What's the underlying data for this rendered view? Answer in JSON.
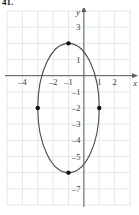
{
  "problem": {
    "number": "41."
  },
  "figure": {
    "axis_labels": {
      "x": "y",
      "x_axis": "x",
      "y_axis": "y"
    },
    "x_axis_name": "x",
    "y_axis_name": "y"
  },
  "chart_data": {
    "type": "scatter",
    "title": "",
    "subtitle": "",
    "xlabel": "x",
    "ylabel": "y",
    "grid": true,
    "legend": null,
    "xlim": [
      -5,
      3
    ],
    "ylim": [
      -8,
      4
    ],
    "xticks": [
      -4,
      -2,
      -1,
      1,
      2
    ],
    "xtick_labels": [
      "–4",
      "–2",
      "–1",
      "1",
      "2"
    ],
    "yticks": [
      3,
      1,
      -1,
      -2,
      -3,
      -4,
      -5,
      -7
    ],
    "ytick_labels": [
      "3",
      "1",
      "–1",
      "–2",
      "–3",
      "–4",
      "–5",
      "–7"
    ],
    "grid_step": 1,
    "curve": {
      "shape": "ellipse",
      "center": [
        -1,
        -2
      ],
      "semi_axis_x": 2,
      "semi_axis_y": 4,
      "stroke": "#4a4a4a",
      "stroke_width": 1.1,
      "fill": "none"
    },
    "points": [
      {
        "label": "top-vertex",
        "x": -1,
        "y": 2
      },
      {
        "label": "right-covertex",
        "x": 1,
        "y": -2
      },
      {
        "label": "bottom-vertex",
        "x": -1,
        "y": -6
      },
      {
        "label": "left-covertex",
        "x": -3,
        "y": -2
      }
    ],
    "point_style": {
      "color": "#111111",
      "radius": 2.2
    },
    "colors": {
      "grid": "#d6dfe4",
      "axis": "#5a5a5a",
      "curve": "#4a4a4a",
      "point": "#111111",
      "text": "#3a3a3a"
    }
  }
}
